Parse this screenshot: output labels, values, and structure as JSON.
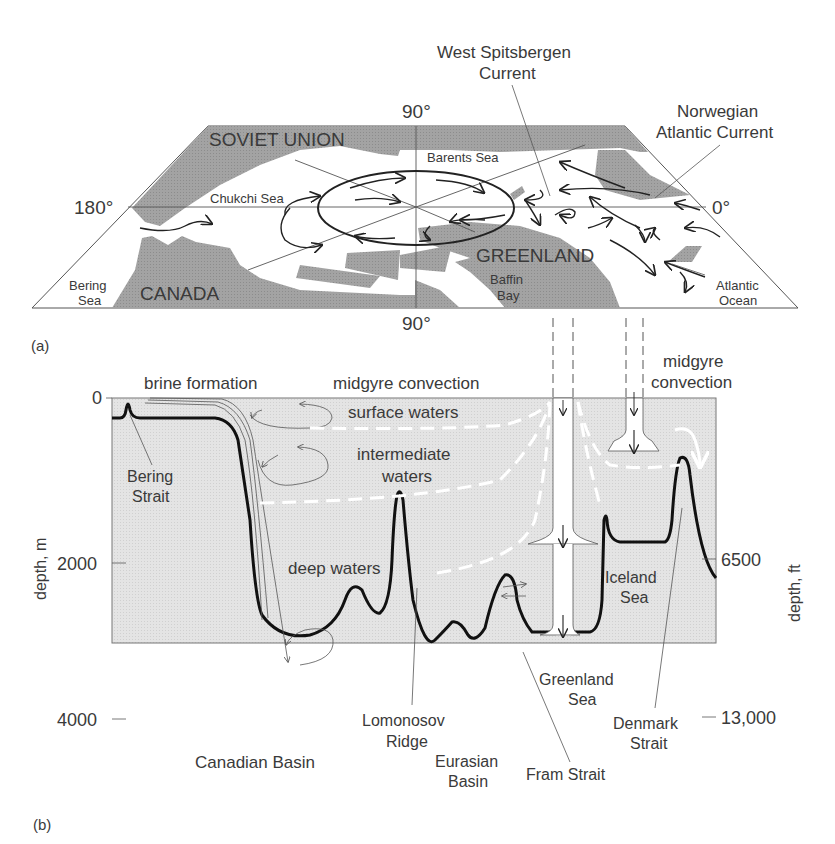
{
  "figure": {
    "panel_a": {
      "label": "(a)",
      "longitudes": {
        "top": "90°",
        "bottom": "90°",
        "left": "180°",
        "right": "0°"
      },
      "landmasses": [
        "SOVIET UNION",
        "CANADA",
        "GREENLAND"
      ],
      "seas": {
        "chukchi": "Chukchi Sea",
        "barents": "Barents Sea",
        "bering": [
          "Bering",
          "Sea"
        ],
        "baffin": [
          "Baffin",
          "Bay"
        ],
        "atlantic": [
          "Atlantic",
          "Ocean"
        ]
      },
      "currents": {
        "west_spitsbergen": [
          "West Spitsbergen",
          "Current"
        ],
        "norwegian_atlantic": [
          "Norwegian",
          "Atlantic Current"
        ]
      }
    },
    "panel_b": {
      "label": "(b)",
      "y_axis_left": {
        "title": "depth, m",
        "ticks": [
          "0",
          "2000",
          "4000"
        ]
      },
      "y_axis_right": {
        "title": "depth, ft",
        "ticks": [
          "6500",
          "13,000"
        ]
      },
      "process_labels": {
        "brine": "brine formation",
        "midgyre1": "midgyre convection",
        "midgyre2": [
          "midgyre",
          "convection"
        ]
      },
      "water_layers": {
        "surface": "surface waters",
        "intermediate": [
          "intermediate",
          "waters"
        ],
        "deep": "deep waters"
      },
      "features": {
        "bering_strait": [
          "Bering",
          "Strait"
        ],
        "canadian_basin": "Canadian Basin",
        "lomonosov": [
          "Lomonosov",
          "Ridge"
        ],
        "eurasian_basin": [
          "Eurasian",
          "Basin"
        ],
        "fram_strait": "Fram Strait",
        "greenland_sea": [
          "Greenland",
          "Sea"
        ],
        "iceland_sea": [
          "Iceland",
          "Sea"
        ],
        "denmark_strait": [
          "Denmark",
          "Strait"
        ]
      }
    }
  }
}
